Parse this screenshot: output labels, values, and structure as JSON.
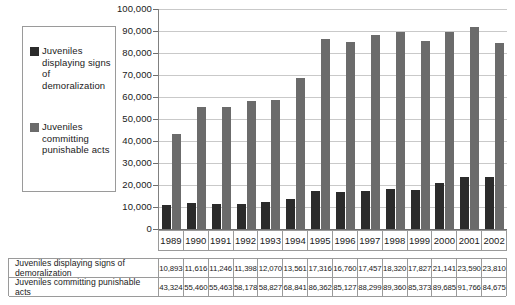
{
  "chart_data": {
    "type": "bar",
    "title": "",
    "xlabel": "",
    "ylabel": "",
    "ylim": [
      0,
      100000
    ],
    "ytick_labels": [
      "100,000",
      "90,000",
      "80,000",
      "70,000",
      "60,000",
      "50,000",
      "40,000",
      "30,000",
      "20,000",
      "10,000",
      "0"
    ],
    "ytick_values": [
      100000,
      90000,
      80000,
      70000,
      60000,
      50000,
      40000,
      30000,
      20000,
      10000,
      0
    ],
    "grid": true,
    "legend_position": "left-outside",
    "categories": [
      "1989",
      "1990",
      "1991",
      "1992",
      "1993",
      "1994",
      "1995",
      "1996",
      "1997",
      "1998",
      "1999",
      "2000",
      "2001",
      "2002"
    ],
    "series": [
      {
        "name": "Juveniles displaying signs of demoralization",
        "color": "#2b2b2b",
        "values": [
          10893,
          11616,
          11246,
          11398,
          12070,
          13561,
          17316,
          16760,
          17457,
          18320,
          17827,
          21141,
          23590,
          23810
        ],
        "value_labels": [
          "10,893",
          "11,616",
          "11,246",
          "11,398",
          "12,070",
          "13,561",
          "17,316",
          "16,760",
          "17,457",
          "18,320",
          "17,827",
          "21,141",
          "23,590",
          "23,810"
        ]
      },
      {
        "name": "Juveniles committing punishable acts",
        "color": "#6b6b6b",
        "values": [
          43324,
          55460,
          55463,
          58178,
          58827,
          68841,
          86362,
          85127,
          88299,
          89360,
          85373,
          89685,
          91766,
          84675
        ],
        "value_labels": [
          "43,324",
          "55,460",
          "55,463",
          "58,178",
          "58,827",
          "68,841",
          "86,362",
          "85,127",
          "88,299",
          "89,360",
          "85,373",
          "89,685",
          "91,766",
          "84,675"
        ]
      }
    ]
  },
  "legend": {
    "items": [
      {
        "label": "Juveniles displaying signs of demoralization",
        "color": "#2b2b2b"
      },
      {
        "label": "Juveniles committing punishable acts",
        "color": "#6b6b6b"
      }
    ]
  },
  "table": {
    "header": [
      "1989",
      "1990",
      "1991",
      "1992",
      "1993",
      "1994",
      "1995",
      "1996",
      "1997",
      "1998",
      "1999",
      "2000",
      "2001",
      "2002"
    ],
    "rows": [
      {
        "label": "Juveniles displaying signs of demoralization",
        "values": [
          "10,893",
          "11,616",
          "11,246",
          "11,398",
          "12,070",
          "13,561",
          "17,316",
          "16,760",
          "17,457",
          "18,320",
          "17,827",
          "21,141",
          "23,590",
          "23,810"
        ]
      },
      {
        "label": "Juveniles committing punishable acts",
        "values": [
          "43,324",
          "55,460",
          "55,463",
          "58,178",
          "58,827",
          "68,841",
          "86,362",
          "85,127",
          "88,299",
          "89,360",
          "85,373",
          "89,685",
          "91,766",
          "84,675"
        ]
      }
    ]
  }
}
